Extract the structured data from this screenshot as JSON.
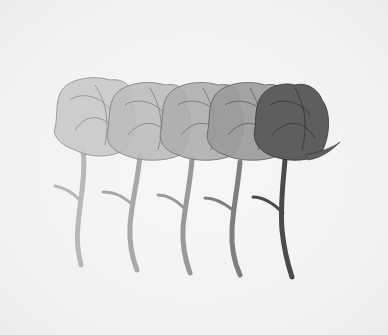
{
  "artwork": {
    "subject": "Five roses in graduated shades of gray",
    "background_color": "#f4f4f4",
    "roses": [
      {
        "index": 1,
        "fill": "#c9c9c9",
        "stroke": "#8a8a8a",
        "stem": "#b8b8b8"
      },
      {
        "index": 2,
        "fill": "#bdbdbd",
        "stroke": "#7d7d7d",
        "stem": "#a8a8a8"
      },
      {
        "index": 3,
        "fill": "#aeaeae",
        "stroke": "#6e6e6e",
        "stem": "#999999"
      },
      {
        "index": 4,
        "fill": "#9a9a9a",
        "stroke": "#5c5c5c",
        "stem": "#7f7f7f"
      },
      {
        "index": 5,
        "fill": "#5e5e5e",
        "stroke": "#333333",
        "stem": "#4a4a4a"
      }
    ]
  }
}
